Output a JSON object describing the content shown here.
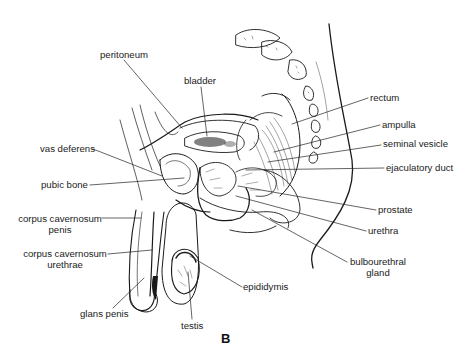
{
  "figure": {
    "panel_letter": "B",
    "caption_fragment": "",
    "labels": {
      "peritoneum": "peritoneum",
      "bladder": "bladder",
      "rectum": "rectum",
      "ampulla": "ampulla",
      "seminal_vesicle": "seminal vesicle",
      "vas_deferens": "vas deferens",
      "ejaculatory_duct": "ejaculatory duct",
      "pubic_bone": "pubic bone",
      "prostate": "prostate",
      "corpus_cavernosum_penis_1": "corpus cavernosum",
      "corpus_cavernosum_penis_2": "penis",
      "urethra": "urethra",
      "corpus_cavernosum_urethrae_1": "corpus cavernosum",
      "corpus_cavernosum_urethrae_2": "urethrae",
      "bulbourethral_gland_1": "bulbourethral",
      "bulbourethral_gland_2": "gland",
      "epididymis": "epididymis",
      "glans_penis": "glans penis",
      "testis": "testis"
    },
    "colors": {
      "ink": "#1a1a1a",
      "background": "#ffffff"
    }
  }
}
